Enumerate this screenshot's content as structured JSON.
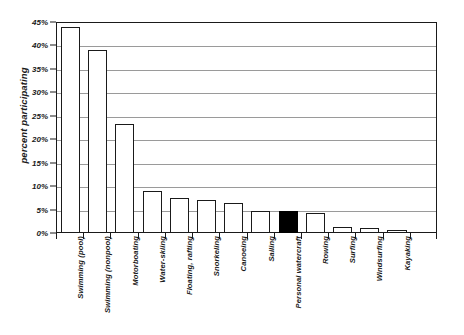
{
  "chart_data": {
    "type": "bar",
    "title": "",
    "xlabel": "",
    "ylabel": "percent participating",
    "ylim": [
      0,
      45
    ],
    "ytick_labels": [
      "0%",
      "5%",
      "10%",
      "15%",
      "20%",
      "25%",
      "30%",
      "35%",
      "40%",
      "45%"
    ],
    "ytick_values": [
      0,
      5,
      10,
      15,
      20,
      25,
      30,
      35,
      40,
      45
    ],
    "grid": true,
    "legend": "none",
    "highlight_category": "Personal watercraft",
    "highlight_color": "#000000",
    "bar_fill_color": "#ffffff",
    "bar_edge_color": "#1a1a1a",
    "grid_color": "#9a9a9a",
    "categories": [
      "Swimming (pool)",
      "Swimming (nonpool)",
      "Motorboating",
      "Water-skiing",
      "Floating, rafting",
      "Snorkeling",
      "Canoeing",
      "Sailing",
      "Personal watercraft",
      "Rowing",
      "Surfing",
      "Windsurfing",
      "Kayaking"
    ],
    "values": [
      44.0,
      39.0,
      23.3,
      8.9,
      7.4,
      7.0,
      6.3,
      4.8,
      4.7,
      4.2,
      1.3,
      1.0,
      0.7
    ]
  }
}
